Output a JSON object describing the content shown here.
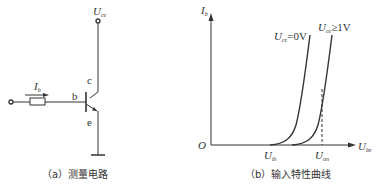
{
  "circuit": {
    "supply_label": "U",
    "supply_sub": "ce",
    "current_label": "I",
    "current_sub": "b",
    "base_label": "b",
    "collector_label": "c",
    "emitter_label": "e",
    "caption": "（a）测量电路"
  },
  "graph": {
    "y_axis_label": "I",
    "y_axis_sub": "b",
    "x_axis_label": "U",
    "x_axis_sub": "be",
    "origin_label": "O",
    "curve1_label": "U",
    "curve1_sub": "ce",
    "curve1_value": "=0V",
    "curve2_label": "U",
    "curve2_sub": "ce",
    "curve2_value": "≥1V",
    "x_tick1_label": "U",
    "x_tick1_sub": "th",
    "x_tick2_label": "U",
    "x_tick2_sub": "on",
    "caption": "（b）输入特性曲线"
  },
  "colors": {
    "line": "#333333",
    "background": "#ffffff"
  }
}
